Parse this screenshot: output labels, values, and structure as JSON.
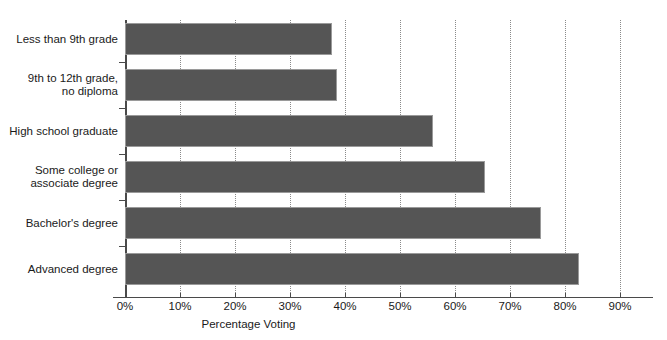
{
  "chart_data": {
    "type": "bar",
    "orientation": "horizontal",
    "title": "",
    "xlabel": "Percentage Voting",
    "ylabel": "",
    "xlim": [
      0,
      93
    ],
    "xticks": [
      "0%",
      "10%",
      "20%",
      "30%",
      "40%",
      "50%",
      "60%",
      "70%",
      "80%",
      "90%"
    ],
    "xtick_values": [
      0,
      10,
      20,
      30,
      40,
      50,
      60,
      70,
      80,
      90
    ],
    "grid": "vertical-dotted",
    "legend": "none",
    "bar_color": "#555555",
    "bar_edge_color": "#9a9a9a",
    "categories": [
      "Less than 9th grade",
      "9th to 12th grade,\nno diploma",
      "High school graduate",
      "Some college or\nassociate degree",
      "Bachelor's degree",
      "Advanced degree"
    ],
    "values": [
      37.6,
      38.5,
      56.0,
      65.5,
      75.6,
      82.5
    ]
  },
  "axis": {
    "x_title": "Percentage Voting"
  },
  "top_clip": {
    "text": ""
  }
}
